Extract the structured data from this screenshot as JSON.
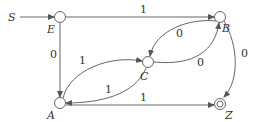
{
  "diagram": {
    "type": "finite-state-automaton",
    "start_label": "S",
    "nodes": [
      {
        "id": "E",
        "label": "E",
        "accepting": false
      },
      {
        "id": "B",
        "label": "B",
        "accepting": false
      },
      {
        "id": "C",
        "label": "C",
        "accepting": false
      },
      {
        "id": "A",
        "label": "A",
        "accepting": false
      },
      {
        "id": "Z",
        "label": "Z",
        "accepting": true
      }
    ],
    "edges": [
      {
        "from": "S",
        "to": "E",
        "label": ""
      },
      {
        "from": "E",
        "to": "B",
        "label": "1"
      },
      {
        "from": "E",
        "to": "A",
        "label": "0"
      },
      {
        "from": "A",
        "to": "C",
        "label": "1"
      },
      {
        "from": "C",
        "to": "A",
        "label": "1"
      },
      {
        "from": "B",
        "to": "C",
        "label": "0"
      },
      {
        "from": "C",
        "to": "B",
        "label": "0"
      },
      {
        "from": "B",
        "to": "Z",
        "label": "0"
      },
      {
        "from": "A",
        "to": "Z",
        "label": "1"
      }
    ]
  },
  "colors": {
    "stroke": "#666666",
    "text": "#333333",
    "background": "#ffffff"
  }
}
